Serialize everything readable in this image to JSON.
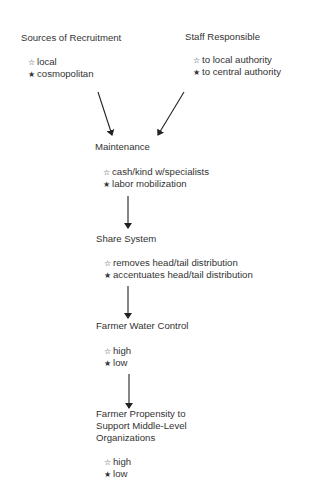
{
  "legend_marks": {
    "open": "☆",
    "filled": "★"
  },
  "nodes": {
    "recruitment": {
      "title": "Sources of Recruitment",
      "items": [
        {
          "mark": "☆",
          "text": "local"
        },
        {
          "mark": "★",
          "text": "cosmopolitan"
        }
      ]
    },
    "staff": {
      "title": "Staff Responsible",
      "items": [
        {
          "mark": "☆",
          "text": "to local authority"
        },
        {
          "mark": "★",
          "text": "to central authority"
        }
      ]
    },
    "maintenance": {
      "title": "Maintenance",
      "items": [
        {
          "mark": "☆",
          "text": "cash/kind w/specialists"
        },
        {
          "mark": "★",
          "text": "labor mobilization"
        }
      ]
    },
    "share": {
      "title": "Share System",
      "items": [
        {
          "mark": "☆",
          "text": "removes head/tail distribution"
        },
        {
          "mark": "★",
          "text": "accentuates head/tail distribution"
        }
      ]
    },
    "water": {
      "title": "Farmer Water Control",
      "items": [
        {
          "mark": "☆",
          "text": "high"
        },
        {
          "mark": "★",
          "text": "low"
        }
      ]
    },
    "propensity": {
      "title_lines": [
        "Farmer Propensity to",
        "Support Middle-Level",
        "Organizations"
      ],
      "items": [
        {
          "mark": "☆",
          "text": "high"
        },
        {
          "mark": "★",
          "text": "low"
        }
      ]
    }
  },
  "edges": [
    {
      "from": "recruitment",
      "to": "maintenance"
    },
    {
      "from": "staff",
      "to": "maintenance"
    },
    {
      "from": "maintenance",
      "to": "share"
    },
    {
      "from": "share",
      "to": "water"
    },
    {
      "from": "water",
      "to": "propensity"
    }
  ]
}
